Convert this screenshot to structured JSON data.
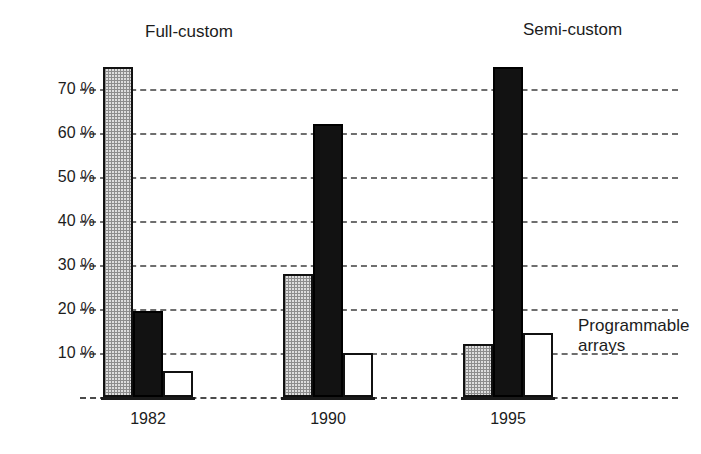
{
  "chart_data": {
    "type": "bar",
    "title": "",
    "subtitle": "",
    "xlabel": "",
    "ylabel": "",
    "categories": [
      "1982",
      "1990",
      "1995"
    ],
    "series": [
      {
        "name": "Full-custom",
        "values": [
          75,
          28,
          12
        ],
        "fill": "gray-checkered",
        "color": "#dedede"
      },
      {
        "name": "Semi-custom",
        "values": [
          19.5,
          62,
          75
        ],
        "fill": "solid-black",
        "color": "#121212"
      },
      {
        "name": "Programmable arrays",
        "values": [
          6,
          10,
          14.5
        ],
        "fill": "white",
        "color": "#ffffff"
      }
    ],
    "ylim": [
      0,
      80
    ],
    "yticks": [
      0,
      10,
      20,
      30,
      40,
      50,
      60,
      70
    ],
    "ytick_labels": [
      "",
      "10 %",
      "20 %",
      "30 %",
      "40 %",
      "50 %",
      "60 %",
      "70 %"
    ],
    "grid": "horizontal-dashed",
    "legend": "inline-annotations",
    "annotations": [
      {
        "id": "full-custom",
        "text": "Full-custom"
      },
      {
        "id": "semi-custom",
        "text": "Semi-custom"
      },
      {
        "id": "programmable",
        "text": "Programmable\narrays"
      }
    ]
  }
}
